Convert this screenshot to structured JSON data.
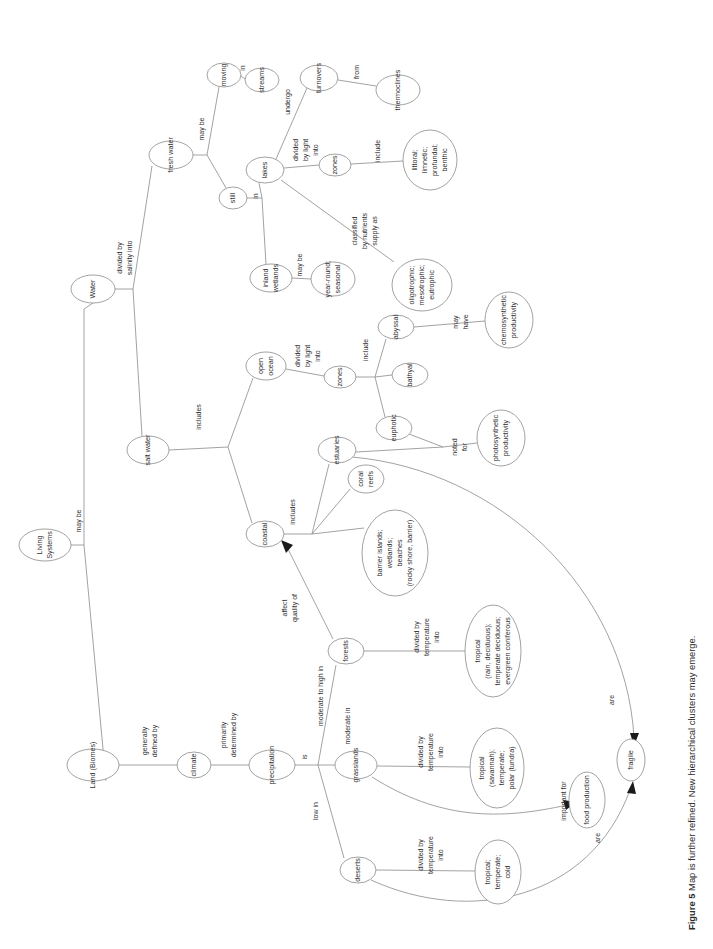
{
  "figure": {
    "label": "Figure 5",
    "caption": "Map is further refined. New hierarchical clusters may emerge."
  },
  "diagram": {
    "type": "concept-map",
    "orientation": "rotated-90-ccw",
    "root": "Living Systems",
    "nodes": [
      {
        "id": "living-systems",
        "label": "Living Systems",
        "cx": 45,
        "cy": 545,
        "rx": 26,
        "ry": 16,
        "lines": [
          "Living",
          "Systems"
        ]
      },
      {
        "id": "water",
        "label": "Water",
        "cx": 93,
        "cy": 289,
        "rx": 22,
        "ry": 14,
        "lines": [
          "Water"
        ]
      },
      {
        "id": "land-biomes",
        "label": "Land (Biomes)",
        "cx": 93,
        "cy": 765,
        "rx": 26,
        "ry": 16,
        "lines": [
          "Land (Biomes)"
        ]
      },
      {
        "id": "fresh-water",
        "label": "fresh water",
        "cx": 171,
        "cy": 155,
        "rx": 22,
        "ry": 14,
        "lines": [
          "fresh water"
        ]
      },
      {
        "id": "salt-water",
        "label": "salt water",
        "cx": 148,
        "cy": 450,
        "rx": 21,
        "ry": 14,
        "lines": [
          "salt water"
        ]
      },
      {
        "id": "moving",
        "label": "moving",
        "cx": 224,
        "cy": 75,
        "rx": 17,
        "ry": 12,
        "lines": [
          "moving"
        ]
      },
      {
        "id": "streams",
        "label": "streams",
        "cx": 262,
        "cy": 80,
        "rx": 17,
        "ry": 12,
        "lines": [
          "streams"
        ]
      },
      {
        "id": "still",
        "label": "still",
        "cx": 233,
        "cy": 198,
        "rx": 14,
        "ry": 11,
        "lines": [
          "still"
        ]
      },
      {
        "id": "lakes",
        "label": "lakes",
        "cx": 265,
        "cy": 170,
        "rx": 19,
        "ry": 13,
        "lines": [
          "lakes"
        ]
      },
      {
        "id": "inland-wetlands",
        "label": "inland wetlands",
        "cx": 271,
        "cy": 278,
        "rx": 21,
        "ry": 14,
        "lines": [
          "inland",
          "wetlands"
        ]
      },
      {
        "id": "turnovers",
        "label": "turnovers",
        "cx": 319,
        "cy": 78,
        "rx": 19,
        "ry": 13,
        "lines": [
          "turnovers"
        ]
      },
      {
        "id": "thermoclines",
        "label": "thermoclines",
        "cx": 398,
        "cy": 90,
        "rx": 22,
        "ry": 15,
        "lines": [
          "thermoclines"
        ]
      },
      {
        "id": "lake-zones",
        "label": "zones",
        "cx": 335,
        "cy": 165,
        "rx": 16,
        "ry": 11,
        "lines": [
          "zones"
        ]
      },
      {
        "id": "lake-zone-list",
        "label": "littoral; limnetic; profundal; benthic",
        "cx": 430,
        "cy": 160,
        "rx": 27,
        "ry": 30,
        "lines": [
          "littoral;",
          "limnetic;",
          "profundal;",
          "benthic"
        ]
      },
      {
        "id": "trophic-list",
        "label": "oligotrophic; mesotrophic; eutrophic",
        "cx": 422,
        "cy": 285,
        "rx": 30,
        "ry": 26,
        "lines": [
          "oligotrophic;",
          "mesotrophic;",
          "eutrophic"
        ]
      },
      {
        "id": "year-round",
        "label": "year-round; seasonal",
        "cx": 333,
        "cy": 279,
        "rx": 22,
        "ry": 17,
        "lines": [
          "year-round;",
          "seasonal"
        ]
      },
      {
        "id": "open-ocean",
        "label": "open ocean",
        "cx": 266,
        "cy": 366,
        "rx": 20,
        "ry": 14,
        "lines": [
          "open",
          "ocean"
        ]
      },
      {
        "id": "ocean-zones",
        "label": "zones",
        "cx": 340,
        "cy": 377,
        "rx": 16,
        "ry": 11,
        "lines": [
          "zones"
        ]
      },
      {
        "id": "abyssal",
        "label": "abyssal",
        "cx": 396,
        "cy": 327,
        "rx": 18,
        "ry": 12,
        "lines": [
          "abyssal"
        ]
      },
      {
        "id": "bathyal",
        "label": "bathyal",
        "cx": 410,
        "cy": 375,
        "rx": 18,
        "ry": 12,
        "lines": [
          "bathyal"
        ]
      },
      {
        "id": "euphotic",
        "label": "euphotic",
        "cx": 394,
        "cy": 428,
        "rx": 18,
        "ry": 12,
        "lines": [
          "euphotic"
        ]
      },
      {
        "id": "chemosynthetic",
        "label": "chemosynthetic productivity",
        "cx": 509,
        "cy": 320,
        "rx": 24,
        "ry": 28,
        "lines": [
          "chemosynthetic",
          "productivity"
        ]
      },
      {
        "id": "photosynthetic",
        "label": "photosynthetic productivity",
        "cx": 501,
        "cy": 438,
        "rx": 24,
        "ry": 28,
        "lines": [
          "photosynthetic",
          "productivity"
        ]
      },
      {
        "id": "coastal",
        "label": "coastal",
        "cx": 265,
        "cy": 534,
        "rx": 19,
        "ry": 13,
        "lines": [
          "coastal"
        ]
      },
      {
        "id": "estuaries",
        "label": "estuaries",
        "cx": 337,
        "cy": 450,
        "rx": 19,
        "ry": 13,
        "lines": [
          "estuaries"
        ]
      },
      {
        "id": "coral-reefs",
        "label": "coral reefs",
        "cx": 366,
        "cy": 479,
        "rx": 18,
        "ry": 14,
        "lines": [
          "coral",
          "reefs"
        ]
      },
      {
        "id": "barrier-list",
        "label": "barrier islands; wetlands; beaches (rocky shore, barrier)",
        "cx": 395,
        "cy": 553,
        "rx": 33,
        "ry": 43,
        "lines": [
          "barrier islands;",
          "wetlands;",
          "beaches",
          "(rocky shore, barrier)"
        ]
      },
      {
        "id": "climate",
        "label": "climate",
        "cx": 194,
        "cy": 765,
        "rx": 17,
        "ry": 13,
        "lines": [
          "climate"
        ]
      },
      {
        "id": "precipitation",
        "label": "precipitation",
        "cx": 272,
        "cy": 765,
        "rx": 23,
        "ry": 15,
        "lines": [
          "precipitation"
        ]
      },
      {
        "id": "forests",
        "label": "forests",
        "cx": 346,
        "cy": 651,
        "rx": 18,
        "ry": 13,
        "lines": [
          "forests"
        ]
      },
      {
        "id": "grasslands",
        "label": "grasslands",
        "cx": 356,
        "cy": 765,
        "rx": 21,
        "ry": 14,
        "lines": [
          "grasslands"
        ]
      },
      {
        "id": "deserts",
        "label": "deserts",
        "cx": 358,
        "cy": 870,
        "rx": 18,
        "ry": 13,
        "lines": [
          "deserts"
        ]
      },
      {
        "id": "forest-types",
        "label": "tropical (rain, deciduous); temperate deciduous; evergreen coniferous",
        "cx": 493,
        "cy": 651,
        "rx": 28,
        "ry": 46,
        "lines": [
          "tropical",
          "(rain, deciduous);",
          "temperate deciduous;",
          "evergreen coniferous"
        ]
      },
      {
        "id": "grassland-types",
        "label": "tropical (savannah); temperate; polar (tundra)",
        "cx": 497,
        "cy": 768,
        "rx": 27,
        "ry": 40,
        "lines": [
          "tropical",
          "(savannah);",
          "temperate;",
          "polar (tundra)"
        ]
      },
      {
        "id": "desert-types",
        "label": "tropical; temperate; cold",
        "cx": 498,
        "cy": 872,
        "rx": 23,
        "ry": 32,
        "lines": [
          "tropical;",
          "temperate;",
          "cold"
        ]
      },
      {
        "id": "food-production",
        "label": "food production",
        "cx": 587,
        "cy": 800,
        "rx": 18,
        "ry": 28,
        "lines": [
          "food production"
        ]
      },
      {
        "id": "fragile",
        "label": "fragile",
        "cx": 631,
        "cy": 760,
        "rx": 14,
        "ry": 21,
        "lines": [
          "fragile"
        ]
      }
    ],
    "links": [
      {
        "from": "living-systems",
        "to": "water",
        "label": "may be"
      },
      {
        "from": "living-systems",
        "to": "land-biomes",
        "label": ""
      },
      {
        "from": "water",
        "to": "fresh-water",
        "label": "divided by salinity into"
      },
      {
        "from": "water",
        "to": "salt-water",
        "label": ""
      },
      {
        "from": "fresh-water",
        "to": "moving",
        "label": "may be"
      },
      {
        "from": "fresh-water",
        "to": "still",
        "label": ""
      },
      {
        "from": "moving",
        "to": "streams",
        "label": "in"
      },
      {
        "from": "still",
        "to": "lakes",
        "label": "in"
      },
      {
        "from": "still",
        "to": "inland-wetlands",
        "label": ""
      },
      {
        "from": "lakes",
        "to": "turnovers",
        "label": "undergo"
      },
      {
        "from": "turnovers",
        "to": "thermoclines",
        "label": "from"
      },
      {
        "from": "lakes",
        "to": "lake-zones",
        "label": "divided by light into"
      },
      {
        "from": "lake-zones",
        "to": "lake-zone-list",
        "label": "include"
      },
      {
        "from": "lakes",
        "to": "trophic-list",
        "label": "classified by nutrient supply as"
      },
      {
        "from": "inland-wetlands",
        "to": "year-round",
        "label": "may be"
      },
      {
        "from": "salt-water",
        "to": "open-ocean",
        "label": "includes"
      },
      {
        "from": "salt-water",
        "to": "coastal",
        "label": ""
      },
      {
        "from": "open-ocean",
        "to": "ocean-zones",
        "label": "divided by light into"
      },
      {
        "from": "ocean-zones",
        "to": "abyssal",
        "label": "include"
      },
      {
        "from": "ocean-zones",
        "to": "bathyal",
        "label": ""
      },
      {
        "from": "ocean-zones",
        "to": "euphotic",
        "label": ""
      },
      {
        "from": "abyssal",
        "to": "chemosynthetic",
        "label": "may have"
      },
      {
        "from": "euphotic",
        "to": "photosynthetic",
        "label": "noted for"
      },
      {
        "from": "coastal",
        "to": "estuaries",
        "label": "includes"
      },
      {
        "from": "coastal",
        "to": "coral-reefs",
        "label": ""
      },
      {
        "from": "coastal",
        "to": "barrier-list",
        "label": ""
      },
      {
        "from": "estuaries",
        "to": "photosynthetic",
        "label": ""
      },
      {
        "from": "estuaries",
        "to": "fragile",
        "label": "are"
      },
      {
        "from": "land-biomes",
        "to": "climate",
        "label": "generally defined by"
      },
      {
        "from": "climate",
        "to": "precipitation",
        "label": "primarily determined by"
      },
      {
        "from": "precipitation",
        "to": "forests",
        "label": "is / moderate to high in"
      },
      {
        "from": "precipitation",
        "to": "grasslands",
        "label": "moderate in"
      },
      {
        "from": "precipitation",
        "to": "deserts",
        "label": "low in"
      },
      {
        "from": "forests",
        "to": "forest-types",
        "label": "divided by temperature into"
      },
      {
        "from": "grasslands",
        "to": "grassland-types",
        "label": "divided by temperature into"
      },
      {
        "from": "deserts",
        "to": "desert-types",
        "label": "divided by temperature into"
      },
      {
        "from": "grasslands",
        "to": "food-production",
        "label": "important for"
      },
      {
        "from": "deserts",
        "to": "fragile",
        "label": "are"
      },
      {
        "from": "forests",
        "to": "coastal",
        "label": "affect quality of"
      }
    ],
    "edge_labels": {
      "may_be_root": "may be",
      "divided_by_salinity_into": "divided by salinity into",
      "may_be_fresh": "may be",
      "in_moving": "in",
      "in_still": "in",
      "undergo": "undergo",
      "from": "from",
      "divided_by_light_into_lakes": "divided by light into",
      "include_lake_zones": "include",
      "classified_by_nutrient_supply_as": "classified by nutrients supply as",
      "may_be_wetlands": "may be",
      "includes_salt": "includes",
      "divided_by_light_into_ocean": "divided by light into",
      "include_ocean_zones": "include",
      "may_have": "may have",
      "noted_for": "noted for",
      "includes_coastal": "includes",
      "generally_defined_by": "generally defined by",
      "primarily_determined_by": "primarily determined by",
      "is": "is",
      "moderate_to_high_in": "moderate to high in",
      "moderate_in": "moderate in",
      "low_in": "low in",
      "divided_by_temperature_into_forests": "divided by temperature into",
      "divided_by_temperature_into_grasslands": "divided by temperature into",
      "divided_by_temperature_into_deserts": "divided by temperature into",
      "important_for": "important for",
      "are_grass": "are",
      "are_deserts": "are",
      "affect_quality_of": "affect quality of"
    },
    "colors": {
      "stroke": "#8a8a8a",
      "text": "#2f2f2f",
      "background": "#ffffff",
      "arrow": "#1a1a1a"
    }
  }
}
